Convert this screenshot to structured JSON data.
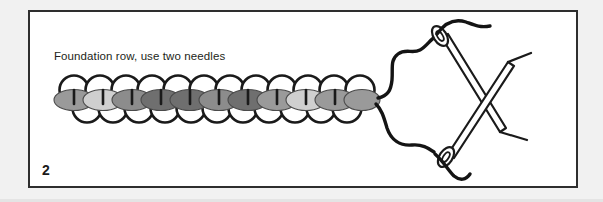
{
  "page": {
    "background_color": "#f1f1f1",
    "frame_background": "#ffffff",
    "frame_border_color": "#2e2e2e"
  },
  "figure": {
    "number": "2",
    "caption": "Foundation row, use two needles",
    "caption_color": "#231f20",
    "title": "Foundation row, use two needles"
  },
  "diagram": {
    "type": "beading-instruction",
    "stroke_color": "#1a1a1a",
    "loop_fill": "#ffffff",
    "bead_tones": [
      "#9a9a9a",
      "#cfcfcf",
      "#8c8c8c",
      "#6f6f6f",
      "#6f6f6f",
      "#8c8c8c",
      "#6f6f6f",
      "#9a9a9a",
      "#cfcfcf",
      "#9a9a9a",
      "#9a9a9a"
    ],
    "bead_count": 11,
    "loop_count": 22,
    "needle_count": 2,
    "needle_fill": "#ffffff",
    "thread_color": "#141414",
    "elements": [
      {
        "name": "bead-chain",
        "label": "bead chain"
      },
      {
        "name": "thread-upper",
        "label": "upper thread strand"
      },
      {
        "name": "thread-lower",
        "label": "lower thread strand"
      },
      {
        "name": "needle-upper",
        "label": "upper needle"
      },
      {
        "name": "needle-lower",
        "label": "lower needle"
      },
      {
        "name": "thread-tail-upper",
        "label": "upper thread tail"
      },
      {
        "name": "thread-tail-lower",
        "label": "lower thread tail"
      }
    ]
  }
}
